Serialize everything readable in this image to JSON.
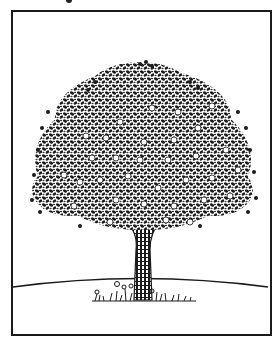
{
  "illustration": {
    "subject": "apple tree line drawing",
    "elements": [
      "frame",
      "canopy",
      "apples",
      "trunk",
      "horizon",
      "grass"
    ],
    "colors": {
      "ink": "#1a1a1a",
      "paper": "#ffffff"
    }
  }
}
